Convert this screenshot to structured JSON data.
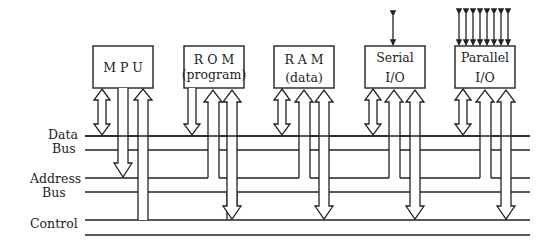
{
  "diagram": {
    "type": "microprocessor-bus-architecture",
    "modules": [
      {
        "id": "mpu",
        "line1": "M P U",
        "line2": ""
      },
      {
        "id": "rom",
        "line1": "R O M",
        "line2": "(program)"
      },
      {
        "id": "ram",
        "line1": "R A M",
        "line2": "(data)"
      },
      {
        "id": "serial",
        "line1": "Serial",
        "line2": "I/O"
      },
      {
        "id": "parallel",
        "line1": "Parallel",
        "line2": "I/O"
      }
    ],
    "buses": {
      "data_1": "Data",
      "data_2": "Bus",
      "address_1": "Address",
      "address_2": "Bus",
      "control": "Control"
    },
    "external_lines": {
      "serial": 1,
      "parallel": 8
    }
  }
}
